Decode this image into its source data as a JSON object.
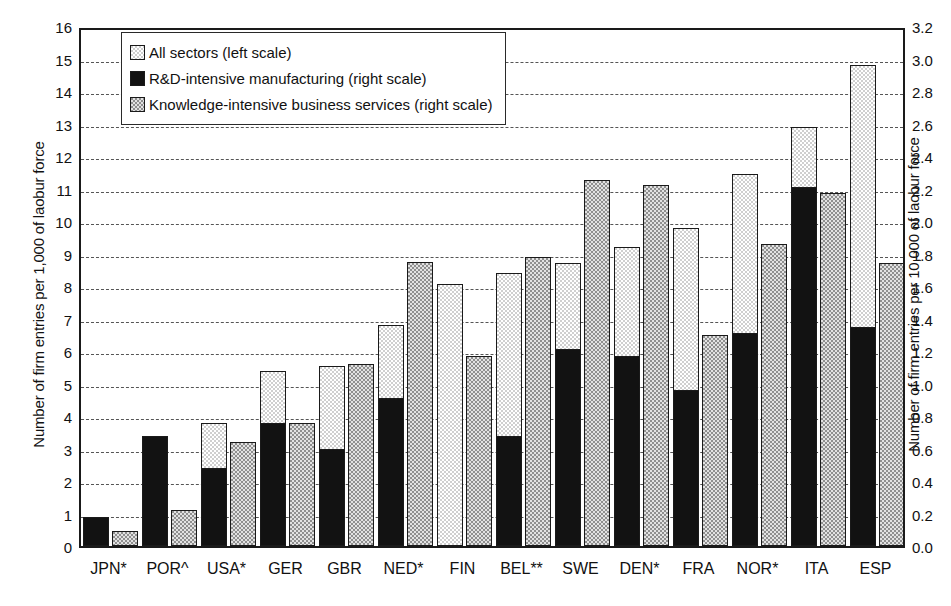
{
  "chart_data": {
    "type": "bar",
    "title": "",
    "subtitle": "",
    "xlabel": "",
    "ylabel": "Number of firm entries per 1,000 of laobur force",
    "y2label": "Number of firm entries per 10,000 of laobur force",
    "grid": true,
    "legend_position": "top-left",
    "ylim": [
      0,
      16
    ],
    "y2lim": [
      0.0,
      3.2
    ],
    "yticks": [
      0,
      1,
      2,
      3,
      4,
      5,
      6,
      7,
      8,
      9,
      10,
      11,
      12,
      13,
      14,
      15,
      16
    ],
    "ytick_labels": [
      "0",
      "1",
      "2",
      "3",
      "4",
      "5",
      "6",
      "7",
      "8",
      "9",
      "10",
      "11",
      "12",
      "13",
      "14",
      "15",
      "16"
    ],
    "y2ticks": [
      0.0,
      0.2,
      0.4,
      0.6,
      0.8,
      1.0,
      1.2,
      1.4,
      1.6,
      1.8,
      2.0,
      2.2,
      2.4,
      2.6,
      2.8,
      3.0,
      3.2
    ],
    "y2tick_labels": [
      "0.0",
      "0.2",
      "0.4",
      "0.6",
      "0.8",
      "1.0",
      "1.2",
      "1.4",
      "1.6",
      "1.8",
      "2.0",
      "2.2",
      "2.4",
      "2.6",
      "2.8",
      "3.0",
      "3.2"
    ],
    "categories": [
      "JPN*",
      "POR^",
      "USA*",
      "GER",
      "GBR",
      "NED*",
      "FIN",
      "BEL**",
      "SWE",
      "DEN*",
      "FRA",
      "NOR*",
      "ITA",
      "ESP"
    ],
    "series": [
      {
        "name": "All sectors (left scale)",
        "axis": "left",
        "color": "#cfcfcf",
        "pattern": "light-checker",
        "values": [
          0.9,
          3.0,
          3.8,
          5.4,
          5.55,
          6.8,
          8.05,
          8.4,
          8.7,
          9.2,
          9.8,
          11.45,
          12.9,
          14.8
        ]
      },
      {
        "name": "R&D-intensive manufacturing (right scale)",
        "axis": "right",
        "color": "#121212",
        "pattern": "solid",
        "values": [
          0.18,
          0.68,
          0.48,
          0.76,
          0.6,
          0.91,
          0.0,
          0.68,
          1.21,
          1.17,
          0.96,
          1.31,
          2.21,
          1.35
        ]
      },
      {
        "name": "Knowledge-intensive business services (right scale)",
        "axis": "right",
        "color": "#8f8f8f",
        "pattern": "dark-checker",
        "values": [
          0.09,
          0.22,
          0.64,
          0.76,
          1.12,
          1.75,
          1.17,
          1.78,
          2.25,
          2.22,
          1.3,
          1.86,
          2.17,
          1.74
        ]
      }
    ]
  },
  "legend": {
    "items": [
      {
        "label": "All sectors (left scale)",
        "swatch": "sw-all"
      },
      {
        "label": "R&D-intensive manufacturing (right scale)",
        "swatch": "sw-rd"
      },
      {
        "label": "Knowledge-intensive business services (right scale)",
        "swatch": "sw-kibs"
      }
    ]
  }
}
